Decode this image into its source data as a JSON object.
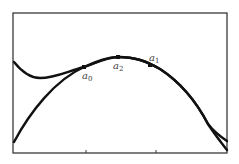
{
  "diagram": {
    "title": "",
    "frame": {
      "x": 13,
      "y": 13,
      "width": 214,
      "height": 140
    },
    "axis_ticks_x": [
      86,
      156
    ],
    "curves": [
      {
        "name": "objective-function",
        "path": "M14,62 C22,72 30,78 40,78 C55,78 68,71 84,67 C98,62 108,57 118,57 C135,57 146,61 160,69 C180,82 197,103 208,124 C215,133 221,137 227,141"
      },
      {
        "name": "interpolating-parabola",
        "path": "M14,142 C30,112 55,80 84,67 C98,61 108,57 118,57 C135,57 146,61 160,69 C180,82 197,103 208,124 C215,135 221,142 227,150"
      }
    ],
    "points": [
      {
        "id": "a0",
        "x": 84,
        "y": 67,
        "label": "a",
        "sub": "0",
        "label_x": 82,
        "label_y": 79
      },
      {
        "id": "a2",
        "x": 118,
        "y": 57,
        "label": "a",
        "sub": "2",
        "label_x": 113,
        "label_y": 69
      },
      {
        "id": "a1",
        "x": 150,
        "y": 65,
        "label": "a",
        "sub": "1",
        "label_x": 149,
        "label_y": 61
      }
    ]
  }
}
